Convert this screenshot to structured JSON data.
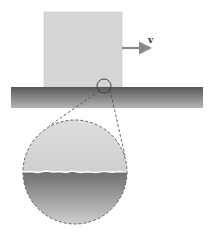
{
  "diagram": {
    "velocity_label": "v",
    "colors": {
      "block_fill": "#d6d6d6",
      "block_stroke": "#bdbdbd",
      "arrow": "#8a8a8a",
      "slab_top": "#585858",
      "slab_bottom": "#b4b4b4",
      "magnifier_upper": "#d9d9d9",
      "magnifier_lower_top": "#6e6e6e",
      "magnifier_lower_bottom": "#d0d0d0",
      "dashed_line": "#555555",
      "interface_line": "#ffffff"
    },
    "elements": [
      {
        "name": "block",
        "x": 44,
        "y": 12,
        "width": 78,
        "height": 75
      },
      {
        "name": "velocity-arrow",
        "from": [
          122,
          48
        ],
        "to": [
          153,
          48
        ]
      },
      {
        "name": "surface-slab",
        "x": 11,
        "y": 87,
        "width": 192,
        "height": 21
      },
      {
        "name": "contact-circle",
        "cx": 104,
        "cy": 86,
        "r": 7
      },
      {
        "name": "magnified-view",
        "cx": 75,
        "cy": 172,
        "r": 52
      }
    ]
  }
}
